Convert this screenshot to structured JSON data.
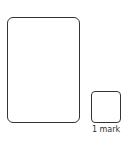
{
  "answer_area": {
    "working_box": {},
    "answer_box": {
      "mark_label": "1 mark"
    }
  },
  "colors": {
    "border": "#333333",
    "background": "#ffffff"
  }
}
